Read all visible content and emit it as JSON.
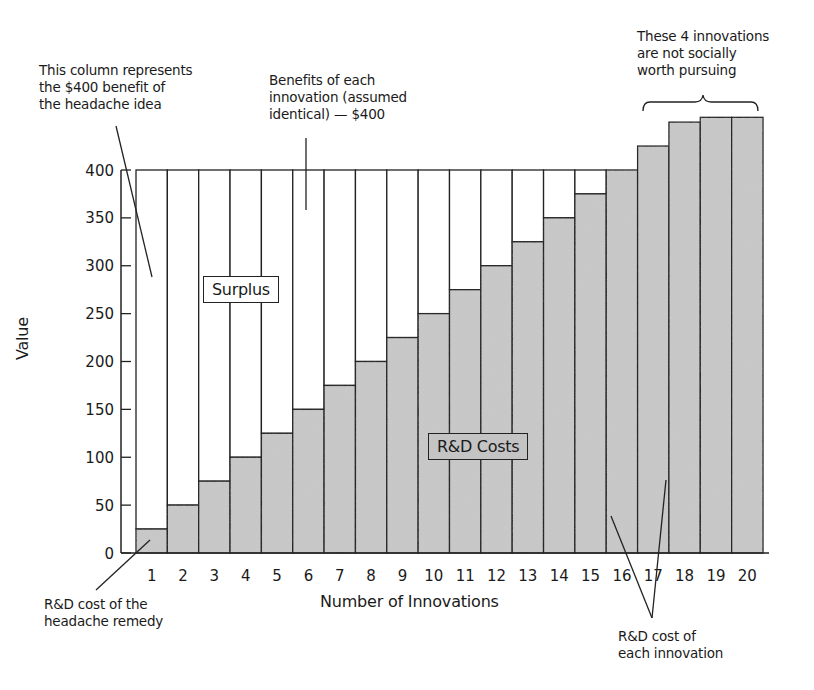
{
  "chart_data": {
    "type": "bar",
    "title": "",
    "xlabel": "Number of Innovations",
    "ylabel": "Value",
    "ylim": [
      0,
      400
    ],
    "yticks": [
      0,
      50,
      100,
      150,
      200,
      250,
      300,
      350,
      400
    ],
    "grid": false,
    "categories": [
      "1",
      "2",
      "3",
      "4",
      "5",
      "6",
      "7",
      "8",
      "9",
      "10",
      "11",
      "12",
      "13",
      "14",
      "15",
      "16",
      "17",
      "18",
      "19",
      "20"
    ],
    "series": [
      {
        "name": "Benefits of each innovation",
        "values": [
          400,
          400,
          400,
          400,
          400,
          400,
          400,
          400,
          400,
          400,
          400,
          400,
          400,
          400,
          400,
          400,
          400,
          400,
          400,
          400
        ]
      },
      {
        "name": "R&D Costs",
        "values": [
          25,
          50,
          75,
          100,
          125,
          150,
          175,
          200,
          225,
          250,
          275,
          300,
          325,
          350,
          375,
          400,
          425,
          450,
          455,
          455
        ]
      }
    ],
    "region_labels": {
      "surplus": "Surplus",
      "costs": "R&D Costs"
    },
    "annotations": {
      "column_note": [
        "This column represents",
        "the $400 benefit of",
        "the headache idea"
      ],
      "benefit_note": [
        "Benefits of each",
        "innovation (assumed",
        "identical) — $400"
      ],
      "not_worth_note": [
        "These 4 innovations",
        "are not socially",
        "worth pursuing"
      ],
      "headache_cost_note": [
        "R&D cost of the",
        "headache remedy"
      ],
      "each_cost_note": [
        "R&D cost of",
        "each innovation"
      ]
    },
    "colors": {
      "cost_fill": "#c8c8c8",
      "benefit_fill": "#ffffff",
      "stroke": "#222222"
    }
  }
}
